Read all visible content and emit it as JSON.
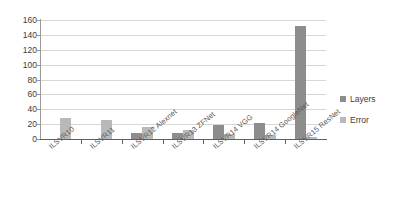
{
  "chart_data": {
    "type": "bar",
    "title": "",
    "xlabel": "",
    "ylabel": "",
    "ylim": [
      0,
      160
    ],
    "ytick_step": 20,
    "yticks": [
      "0",
      "20",
      "40",
      "60",
      "80",
      "100",
      "120",
      "140",
      "160"
    ],
    "grid": true,
    "legend_position": "right",
    "categories": [
      "ILSVR10",
      "ILSVR11",
      "ILSVR12 Alexnet",
      "ILSVR13 ZFNet",
      "ILSVR14 VGG",
      "ILSVR14 GoogleNet",
      "ILSVR15 ResNet"
    ],
    "series": [
      {
        "name": "Layers",
        "color": "#8d8d8d",
        "values": [
          0,
          0,
          8,
          8,
          19,
          22,
          152
        ]
      },
      {
        "name": "Error",
        "color": "#b9b9b9",
        "values": [
          28,
          26,
          16,
          12,
          7,
          6,
          3
        ]
      }
    ]
  },
  "legend": {
    "items": [
      {
        "label": "Layers",
        "color": "#8d8d8d"
      },
      {
        "label": "Error",
        "color": "#b9b9b9"
      }
    ]
  }
}
